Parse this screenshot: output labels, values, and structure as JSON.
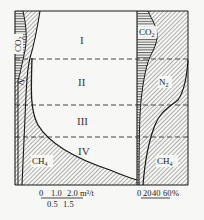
{
  "zones": [
    {
      "label": "I"
    },
    {
      "label": "II"
    },
    {
      "label": "III"
    },
    {
      "label": "IV"
    }
  ],
  "left_panel": {
    "gases": {
      "co2": "CO",
      "co2_sub": "2",
      "n2": "N",
      "n2_sub": "2",
      "ch4": "CH",
      "ch4_sub": "4"
    },
    "axis": {
      "upper_ticks": [
        "0",
        "1.0",
        "2.0"
      ],
      "lower_ticks": [
        "0.5",
        "1.5"
      ],
      "unit": "m³/t"
    }
  },
  "right_panel": {
    "gases": {
      "co2": "CO",
      "co2_sub": "2",
      "n2": "N",
      "n2_sub": "2",
      "ch4": "CH",
      "ch4_sub": "4"
    },
    "axis": {
      "ticks": [
        "0",
        "20",
        "40",
        "60"
      ],
      "unit": "%"
    }
  },
  "colors": {
    "line": "#1a1a1a",
    "hatch": "#555555",
    "background": "#f7f7f5"
  }
}
